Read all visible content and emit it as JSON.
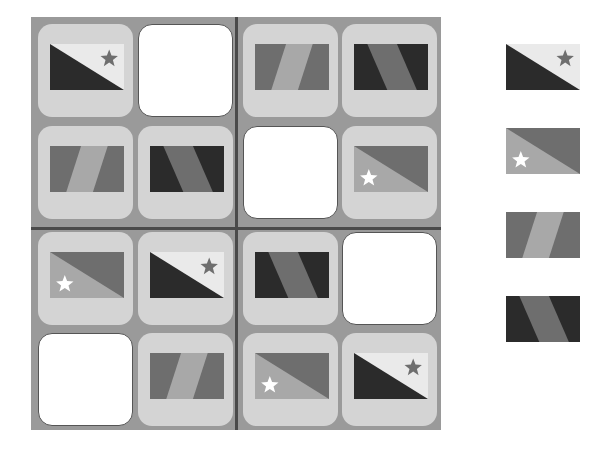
{
  "puzzle": {
    "type": "flag sudoku 4x4",
    "grid": [
      [
        "flag-a",
        "empty",
        "flag-c",
        "flag-d"
      ],
      [
        "flag-c",
        "flag-d",
        "empty",
        "flag-b"
      ],
      [
        "flag-b",
        "flag-a",
        "flag-d",
        "empty"
      ],
      [
        "empty",
        "flag-c",
        "flag-b",
        "flag-a"
      ]
    ]
  },
  "options": [
    "flag-a",
    "flag-b",
    "flag-c",
    "flag-d"
  ],
  "colors": {
    "board_bg": "#9a9a9a",
    "divider": "#4a4a4a",
    "cell_bg": "#d4d4d4",
    "empty_bg": "#ffffff",
    "flag_dark": "#2b2b2b",
    "flag_mid": "#6e6e6e",
    "flag_light": "#eaeaea",
    "flag_stripe": "#a8a8a8"
  }
}
